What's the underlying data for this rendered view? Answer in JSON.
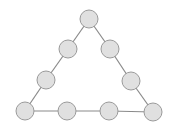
{
  "diagram": {
    "type": "triangle-of-nodes",
    "node_style": {
      "fill": "#e0e0e0",
      "stroke": "#9a9a9a",
      "radius": 9
    },
    "edge_color": "#8a8a8a",
    "nodes": [
      {
        "id": "top",
        "x": 89,
        "y": 19
      },
      {
        "id": "left-upper",
        "x": 68,
        "y": 49
      },
      {
        "id": "right-upper",
        "x": 110,
        "y": 49
      },
      {
        "id": "left-lower",
        "x": 46,
        "y": 80
      },
      {
        "id": "right-lower",
        "x": 131,
        "y": 81
      },
      {
        "id": "bottom-1",
        "x": 25,
        "y": 111
      },
      {
        "id": "bottom-2",
        "x": 67,
        "y": 111
      },
      {
        "id": "bottom-3",
        "x": 109,
        "y": 111
      },
      {
        "id": "bottom-4",
        "x": 153,
        "y": 112
      }
    ],
    "edges": [
      [
        "top",
        "left-upper"
      ],
      [
        "left-upper",
        "left-lower"
      ],
      [
        "left-lower",
        "bottom-1"
      ],
      [
        "top",
        "right-upper"
      ],
      [
        "right-upper",
        "right-lower"
      ],
      [
        "right-lower",
        "bottom-4"
      ],
      [
        "bottom-1",
        "bottom-2"
      ],
      [
        "bottom-2",
        "bottom-3"
      ],
      [
        "bottom-3",
        "bottom-4"
      ]
    ]
  }
}
